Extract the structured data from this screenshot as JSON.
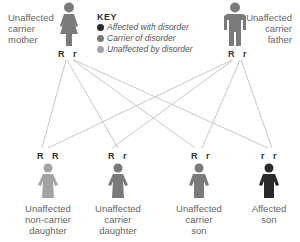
{
  "colors": {
    "affected": "#2a2a2a",
    "carrier": "#7a7a7a",
    "unaffected": "#a3a3a3",
    "lines": "#c8c8c8"
  },
  "key": {
    "title": "KEY",
    "items": [
      {
        "label": "Affected with disorder",
        "status": "affected"
      },
      {
        "label": "Carrier of disorder",
        "status": "carrier"
      },
      {
        "label": "Unaffected by disorder",
        "status": "unaffected"
      }
    ]
  },
  "parents": {
    "mother": {
      "label_lines": [
        "Unaffected",
        "carrier",
        "mother"
      ],
      "genotype": "R r",
      "status": "carrier",
      "icon": "female-figure-icon"
    },
    "father": {
      "label_lines": [
        "Unaffected",
        "carrier",
        "father"
      ],
      "genotype": "R r",
      "status": "carrier",
      "icon": "male-figure-icon"
    }
  },
  "children": [
    {
      "label_lines": [
        "Unaffected",
        "non-carrier",
        "daughter"
      ],
      "genotype": "R R",
      "status": "unaffected"
    },
    {
      "label_lines": [
        "Unaffected",
        "carrier",
        "daughter"
      ],
      "genotype": "R r",
      "status": "carrier"
    },
    {
      "label_lines": [
        "Unaffected",
        "carrier",
        "son"
      ],
      "genotype": "R r",
      "status": "carrier"
    },
    {
      "label_lines": [
        "Affected",
        "son"
      ],
      "genotype": "r r",
      "status": "affected"
    }
  ]
}
